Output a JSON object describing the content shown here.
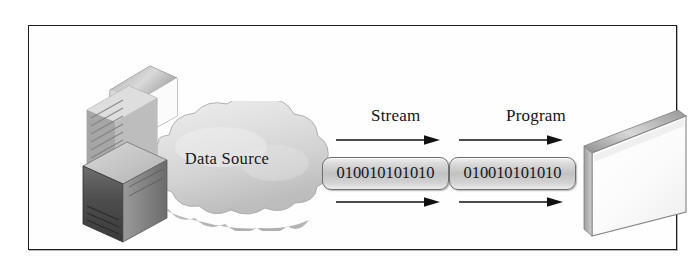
{
  "diagram": {
    "background_color": "#ffffff",
    "frame_border_color": "#1c1c1c",
    "ink_color": "#16161a"
  },
  "cloud": {
    "label": "Data Source",
    "fill_color": "#dcdcdc",
    "edge_color": "#9a9a9a"
  },
  "source_device": {
    "name": "server-with-monitor",
    "body_color": "#4a4a4a",
    "panel_color": "#b9b9b9",
    "monitor_color": "#f2f2f2"
  },
  "labels": {
    "stream": "Stream",
    "program": "Program"
  },
  "stream_blocks": [
    {
      "digits": "010010101010"
    },
    {
      "digits": "010010101010"
    }
  ],
  "arrows": [
    {
      "id": "arrow-top-1",
      "direction": "right",
      "row": "top"
    },
    {
      "id": "arrow-top-2",
      "direction": "right",
      "row": "top"
    },
    {
      "id": "arrow-bottom-1",
      "direction": "right",
      "row": "bottom"
    },
    {
      "id": "arrow-bottom-2",
      "direction": "right",
      "row": "bottom"
    }
  ],
  "program_display": {
    "name": "program-screen",
    "face_color": "#fcfcfc",
    "bevel_color": "#a8a8a8"
  }
}
